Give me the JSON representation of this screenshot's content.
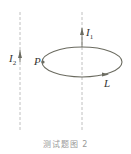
{
  "labels": {
    "i2": {
      "main": "I",
      "sub": "2"
    },
    "i1": {
      "main": "I",
      "sub": "1"
    },
    "p": "P",
    "l": "L"
  },
  "caption": "测试题图 2",
  "colors": {
    "line": "#8a8a80",
    "curve": "#6b6b60",
    "dashed": "#b0b0b0"
  }
}
